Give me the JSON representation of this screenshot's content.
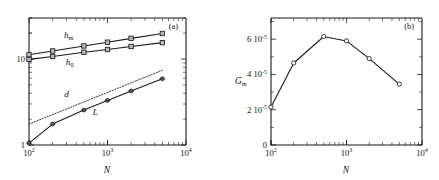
{
  "figure": {
    "width": 439,
    "height": 180,
    "background": "#ffffff",
    "ink_color": "#1a1a1a"
  },
  "chart_data": [
    {
      "type": "line",
      "panel_tag": "(a)",
      "title": "",
      "xlabel": "N",
      "ylabel": "",
      "xscale": "log",
      "yscale": "log",
      "xlim": [
        100,
        10000
      ],
      "ylim": [
        1,
        30
      ],
      "grid": false,
      "legend": "inline-labels",
      "xticks": [
        100,
        1000,
        10000
      ],
      "xticklabels": [
        "10",
        "10",
        "10"
      ],
      "xtick_exponents": [
        "2",
        "3",
        "4"
      ],
      "yticks": [
        1,
        10
      ],
      "yticklabels": [
        "1",
        "10"
      ],
      "series": [
        {
          "name": "h_m",
          "label_base": "h",
          "label_sub": "m",
          "marker": "square",
          "linestyle": "solid",
          "x": [
            100,
            200,
            500,
            1000,
            2000,
            5000
          ],
          "y": [
            11.2,
            12.4,
            14.2,
            15.7,
            17.4,
            19.8
          ]
        },
        {
          "name": "h_0",
          "label_base": "h",
          "label_sub": "0",
          "marker": "square",
          "linestyle": "solid",
          "x": [
            100,
            200,
            500,
            1000,
            2000,
            5000
          ],
          "y": [
            9.9,
            10.7,
            12.0,
            12.9,
            14.0,
            15.5
          ]
        },
        {
          "name": "d",
          "label_base": "d",
          "label_sub": "",
          "marker": "none",
          "linestyle": "dotted",
          "x": [
            100,
            5000
          ],
          "y": [
            1.75,
            7.4
          ]
        },
        {
          "name": "L",
          "label_base": "L",
          "label_sub": "",
          "marker": "point",
          "linestyle": "solid",
          "x": [
            100,
            200,
            500,
            1000,
            2000,
            5000
          ],
          "y": [
            1.05,
            1.75,
            2.55,
            3.3,
            4.25,
            5.9
          ]
        }
      ]
    },
    {
      "type": "line",
      "panel_tag": "(b)",
      "title": "",
      "xlabel": "N",
      "ylabel_base": "G",
      "ylabel_sub": "m",
      "xscale": "log",
      "yscale": "linear",
      "xlim": [
        100,
        10000
      ],
      "ylim": [
        0,
        7.2e-05
      ],
      "grid": false,
      "xticks": [
        100,
        1000,
        10000
      ],
      "xticklabels": [
        "10",
        "10",
        "10"
      ],
      "xtick_exponents": [
        "2",
        "3",
        "4"
      ],
      "yticks": [
        0,
        2e-05,
        4e-05,
        6e-05
      ],
      "yticklabels": [
        "0",
        "2 10",
        "4 10",
        "6 10"
      ],
      "ytick_exponents": [
        "",
        "-5",
        "-5",
        "-5"
      ],
      "series": [
        {
          "name": "G_m",
          "marker": "open-circle",
          "linestyle": "solid",
          "x": [
            100,
            200,
            500,
            1000,
            2000,
            5000
          ],
          "y": [
            2.15e-05,
            4.65e-05,
            6.15e-05,
            5.9e-05,
            4.9e-05,
            3.45e-05
          ]
        }
      ]
    }
  ]
}
